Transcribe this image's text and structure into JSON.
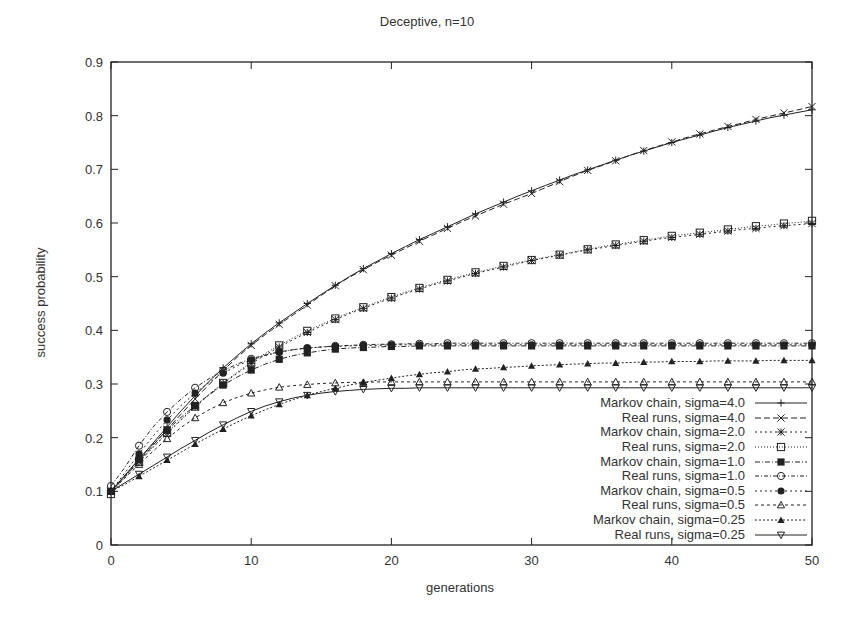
{
  "chart": {
    "title": "Deceptive, n=10",
    "xlabel": "generations",
    "ylabel": "success probability"
  },
  "legend": [
    {
      "label": "Markov chain, sigma=4.0"
    },
    {
      "label": "Real runs, sigma=4.0"
    },
    {
      "label": "Markov chain, sigma=2.0"
    },
    {
      "label": "Real runs, sigma=2.0"
    },
    {
      "label": "Markov chain, sigma=1.0"
    },
    {
      "label": "Real runs, sigma=1.0"
    },
    {
      "label": "Markov chain, sigma=0.5"
    },
    {
      "label": "Real runs, sigma=0.5"
    },
    {
      "label": "Markov chain, sigma=0.25"
    },
    {
      "label": "Real runs, sigma=0.25"
    }
  ],
  "chart_data": {
    "type": "line",
    "title": "Deceptive, n=10",
    "xlabel": "generations",
    "ylabel": "success probability",
    "xlim": [
      0,
      50
    ],
    "ylim": [
      0,
      0.9
    ],
    "xticks": [
      0,
      10,
      20,
      30,
      40,
      50
    ],
    "yticks": [
      0,
      0.1,
      0.2,
      0.3,
      0.4,
      0.5,
      0.6,
      0.7,
      0.8,
      0.9
    ],
    "grid": false,
    "legend_position": "lower right",
    "x": [
      0,
      1,
      2,
      3,
      4,
      5,
      6,
      7,
      8,
      9,
      10,
      11,
      12,
      13,
      14,
      15,
      16,
      17,
      18,
      19,
      20,
      21,
      22,
      23,
      24,
      25,
      26,
      27,
      28,
      29,
      30,
      31,
      32,
      33,
      34,
      35,
      36,
      37,
      38,
      39,
      40,
      41,
      42,
      43,
      44,
      45,
      46,
      47,
      48,
      49,
      50
    ],
    "series": [
      {
        "name": "Markov chain, sigma=4.0",
        "marker": "plus",
        "dash": "",
        "values": [
          0.1,
          0.13,
          0.16,
          0.19,
          0.22,
          0.25,
          0.278,
          0.305,
          0.33,
          0.353,
          0.375,
          0.395,
          0.414,
          0.432,
          0.45,
          0.467,
          0.484,
          0.5,
          0.515,
          0.529,
          0.543,
          0.556,
          0.569,
          0.581,
          0.593,
          0.605,
          0.617,
          0.628,
          0.639,
          0.65,
          0.66,
          0.67,
          0.68,
          0.69,
          0.699,
          0.708,
          0.717,
          0.726,
          0.734,
          0.742,
          0.75,
          0.757,
          0.764,
          0.771,
          0.778,
          0.784,
          0.79,
          0.796,
          0.801,
          0.806,
          0.811
        ]
      },
      {
        "name": "Real runs, sigma=4.0",
        "marker": "x",
        "dash": "6,3",
        "values": [
          0.1,
          0.128,
          0.157,
          0.186,
          0.215,
          0.244,
          0.272,
          0.299,
          0.325,
          0.35,
          0.372,
          0.392,
          0.411,
          0.429,
          0.447,
          0.465,
          0.483,
          0.499,
          0.513,
          0.527,
          0.54,
          0.553,
          0.566,
          0.578,
          0.59,
          0.602,
          0.613,
          0.624,
          0.635,
          0.645,
          0.655,
          0.666,
          0.677,
          0.688,
          0.698,
          0.707,
          0.716,
          0.726,
          0.735,
          0.743,
          0.751,
          0.759,
          0.766,
          0.773,
          0.78,
          0.786,
          0.793,
          0.799,
          0.805,
          0.811,
          0.817
        ]
      },
      {
        "name": "Markov chain, sigma=2.0",
        "marker": "star",
        "dash": "2,3",
        "values": [
          0.1,
          0.128,
          0.155,
          0.182,
          0.208,
          0.233,
          0.257,
          0.28,
          0.301,
          0.32,
          0.338,
          0.354,
          0.369,
          0.383,
          0.396,
          0.408,
          0.42,
          0.431,
          0.441,
          0.451,
          0.46,
          0.469,
          0.477,
          0.485,
          0.492,
          0.499,
          0.506,
          0.512,
          0.518,
          0.524,
          0.53,
          0.535,
          0.54,
          0.545,
          0.55,
          0.554,
          0.558,
          0.562,
          0.566,
          0.57,
          0.573,
          0.576,
          0.579,
          0.582,
          0.585,
          0.588,
          0.59,
          0.593,
          0.595,
          0.597,
          0.599
        ]
      },
      {
        "name": "Real runs, sigma=2.0",
        "marker": "square",
        "dash": "1,2",
        "values": [
          0.095,
          0.126,
          0.155,
          0.183,
          0.209,
          0.234,
          0.258,
          0.281,
          0.302,
          0.322,
          0.34,
          0.357,
          0.372,
          0.386,
          0.399,
          0.411,
          0.422,
          0.433,
          0.443,
          0.453,
          0.462,
          0.471,
          0.479,
          0.487,
          0.494,
          0.501,
          0.508,
          0.514,
          0.52,
          0.526,
          0.531,
          0.536,
          0.541,
          0.546,
          0.551,
          0.556,
          0.56,
          0.564,
          0.568,
          0.572,
          0.576,
          0.579,
          0.582,
          0.585,
          0.588,
          0.591,
          0.594,
          0.596,
          0.599,
          0.601,
          0.604
        ]
      },
      {
        "name": "Markov chain, sigma=1.0",
        "marker": "filled-square",
        "dash": "5,2,1,2",
        "values": [
          0.1,
          0.13,
          0.16,
          0.188,
          0.214,
          0.238,
          0.26,
          0.28,
          0.298,
          0.313,
          0.326,
          0.337,
          0.346,
          0.353,
          0.358,
          0.362,
          0.365,
          0.367,
          0.368,
          0.369,
          0.37,
          0.37,
          0.371,
          0.371,
          0.371,
          0.371,
          0.371,
          0.371,
          0.371,
          0.371,
          0.371,
          0.371,
          0.371,
          0.371,
          0.371,
          0.371,
          0.371,
          0.371,
          0.371,
          0.371,
          0.371,
          0.371,
          0.371,
          0.371,
          0.371,
          0.371,
          0.371,
          0.371,
          0.371,
          0.371,
          0.371
        ]
      },
      {
        "name": "Real runs, sigma=1.0",
        "marker": "circle",
        "dash": "4,2,1,2",
        "values": [
          0.11,
          0.145,
          0.185,
          0.22,
          0.248,
          0.272,
          0.293,
          0.31,
          0.325,
          0.337,
          0.347,
          0.354,
          0.36,
          0.364,
          0.367,
          0.369,
          0.371,
          0.372,
          0.373,
          0.374,
          0.374,
          0.375,
          0.375,
          0.375,
          0.376,
          0.376,
          0.376,
          0.376,
          0.376,
          0.376,
          0.376,
          0.376,
          0.376,
          0.376,
          0.376,
          0.376,
          0.376,
          0.376,
          0.376,
          0.376,
          0.376,
          0.376,
          0.376,
          0.376,
          0.376,
          0.376,
          0.376,
          0.376,
          0.376,
          0.376,
          0.376
        ]
      },
      {
        "name": "Markov chain, sigma=0.5",
        "marker": "filled-circle",
        "dash": "2,3",
        "values": [
          0.1,
          0.135,
          0.17,
          0.203,
          0.233,
          0.26,
          0.283,
          0.303,
          0.32,
          0.334,
          0.345,
          0.353,
          0.359,
          0.364,
          0.367,
          0.369,
          0.37,
          0.371,
          0.372,
          0.372,
          0.373,
          0.373,
          0.373,
          0.373,
          0.373,
          0.373,
          0.373,
          0.373,
          0.373,
          0.373,
          0.373,
          0.373,
          0.373,
          0.373,
          0.373,
          0.373,
          0.373,
          0.373,
          0.373,
          0.373,
          0.373,
          0.373,
          0.373,
          0.373,
          0.373,
          0.373,
          0.373,
          0.373,
          0.373,
          0.373,
          0.373
        ]
      },
      {
        "name": "Real runs, sigma=0.5",
        "marker": "triangle",
        "dash": "3,3",
        "values": [
          0.1,
          0.125,
          0.15,
          0.175,
          0.198,
          0.219,
          0.237,
          0.252,
          0.265,
          0.275,
          0.283,
          0.289,
          0.294,
          0.297,
          0.299,
          0.301,
          0.302,
          0.303,
          0.303,
          0.304,
          0.304,
          0.304,
          0.304,
          0.304,
          0.304,
          0.304,
          0.304,
          0.304,
          0.304,
          0.304,
          0.304,
          0.304,
          0.304,
          0.304,
          0.304,
          0.304,
          0.304,
          0.304,
          0.304,
          0.304,
          0.304,
          0.304,
          0.304,
          0.304,
          0.304,
          0.304,
          0.304,
          0.304,
          0.304,
          0.304,
          0.304
        ]
      },
      {
        "name": "Markov chain, sigma=0.25",
        "marker": "filled-triangle",
        "dash": "2,2",
        "values": [
          0.1,
          0.113,
          0.128,
          0.143,
          0.158,
          0.173,
          0.188,
          0.202,
          0.216,
          0.229,
          0.241,
          0.252,
          0.262,
          0.271,
          0.279,
          0.286,
          0.292,
          0.298,
          0.303,
          0.307,
          0.311,
          0.315,
          0.318,
          0.321,
          0.323,
          0.326,
          0.328,
          0.329,
          0.331,
          0.332,
          0.334,
          0.335,
          0.336,
          0.337,
          0.338,
          0.339,
          0.339,
          0.34,
          0.341,
          0.341,
          0.342,
          0.342,
          0.342,
          0.343,
          0.343,
          0.343,
          0.343,
          0.344,
          0.344,
          0.344,
          0.344
        ]
      },
      {
        "name": "Real runs, sigma=0.25",
        "marker": "down-triangle",
        "dash": "",
        "values": [
          0.1,
          0.116,
          0.132,
          0.148,
          0.164,
          0.18,
          0.195,
          0.21,
          0.224,
          0.237,
          0.249,
          0.259,
          0.267,
          0.274,
          0.279,
          0.283,
          0.286,
          0.288,
          0.29,
          0.291,
          0.292,
          0.292,
          0.293,
          0.293,
          0.293,
          0.293,
          0.293,
          0.293,
          0.293,
          0.293,
          0.293,
          0.293,
          0.293,
          0.293,
          0.293,
          0.293,
          0.293,
          0.293,
          0.293,
          0.293,
          0.293,
          0.293,
          0.293,
          0.293,
          0.293,
          0.293,
          0.293,
          0.293,
          0.293,
          0.293,
          0.293
        ]
      }
    ]
  }
}
